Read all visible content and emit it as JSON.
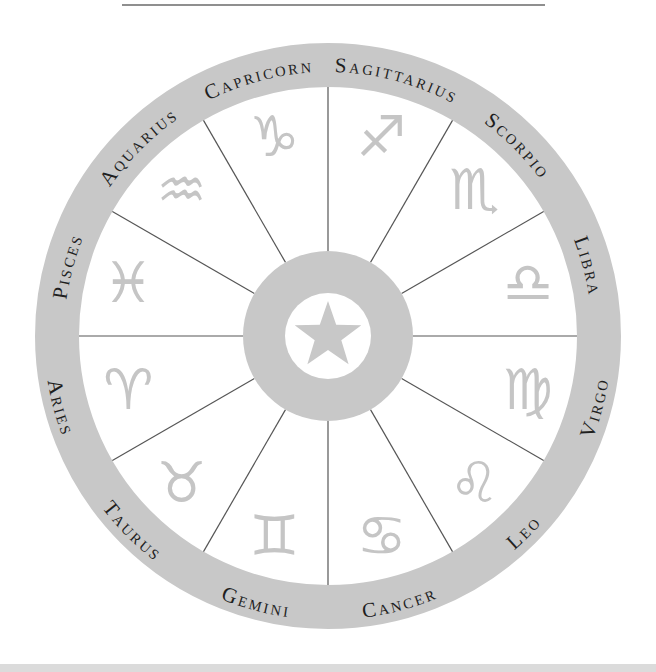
{
  "colors": {
    "background": "#ffffff",
    "ring": "#c8c8c8",
    "symbol": "#c5c5c5",
    "label": "#1f1f1f",
    "divider": "#565656",
    "top_rule": "#8f8f8f",
    "bottom_strip": "#dbdbdb"
  },
  "wheel": {
    "center_icon": "star-icon",
    "signs": [
      {
        "name": "Sagittarius",
        "symbol": "♐",
        "mid_angle": 15
      },
      {
        "name": "Scorpio",
        "symbol": "♏",
        "mid_angle": 45
      },
      {
        "name": "Libra",
        "symbol": "♎",
        "mid_angle": 75
      },
      {
        "name": "Virgo",
        "symbol": "♍",
        "mid_angle": 105
      },
      {
        "name": "Leo",
        "symbol": "♌",
        "mid_angle": 135
      },
      {
        "name": "Cancer",
        "symbol": "♋",
        "mid_angle": 165
      },
      {
        "name": "Gemini",
        "symbol": "♊",
        "mid_angle": 195
      },
      {
        "name": "Taurus",
        "symbol": "♉",
        "mid_angle": 225
      },
      {
        "name": "Aries",
        "symbol": "♈",
        "mid_angle": 255
      },
      {
        "name": "Pisces",
        "symbol": "♓",
        "mid_angle": 285
      },
      {
        "name": "Aquarius",
        "symbol": "♒",
        "mid_angle": 315
      },
      {
        "name": "Capricorn",
        "symbol": "♑",
        "mid_angle": 345
      }
    ]
  }
}
